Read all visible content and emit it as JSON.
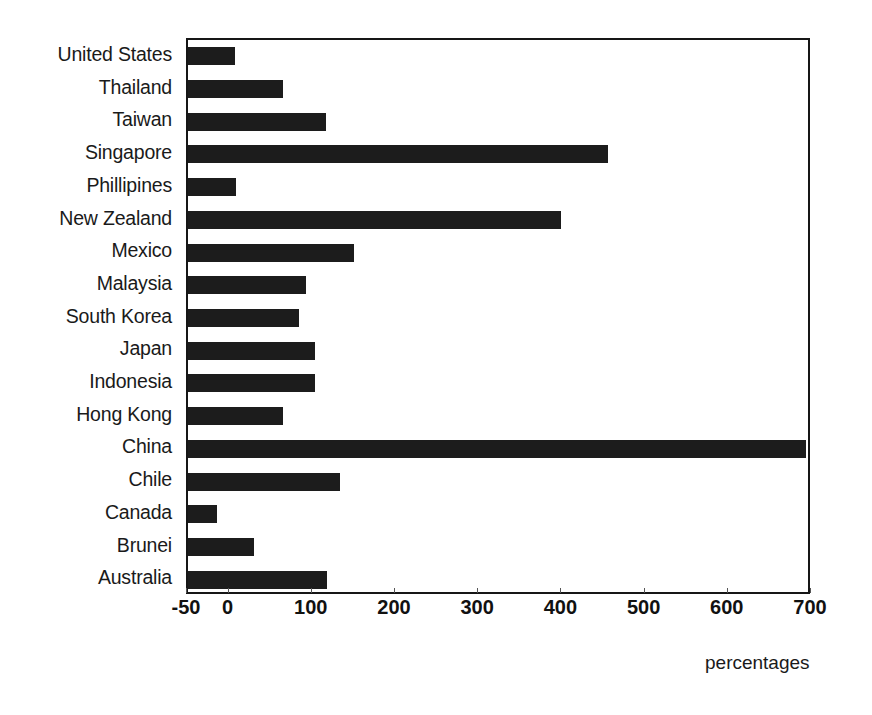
{
  "chart_data": {
    "type": "bar",
    "orientation": "horizontal",
    "title": "",
    "subtitle": "",
    "xlabel": "percentages",
    "ylabel": "",
    "categories": [
      "United States",
      "Thailand",
      "Taiwan",
      "Singapore",
      "Phillipines",
      "New Zealand",
      "Mexico",
      "Malaysia",
      "South Korea",
      "Japan",
      "Indonesia",
      "Hong Kong",
      "China",
      "Chile",
      "Canada",
      "Brunei",
      "Australia"
    ],
    "values": [
      7,
      64,
      116,
      455,
      8,
      398,
      149,
      92,
      83,
      103,
      103,
      64,
      693,
      133,
      -15,
      29,
      117
    ],
    "xlim": [
      -50,
      700
    ],
    "xticks": [
      -50,
      0,
      100,
      200,
      300,
      400,
      500,
      600,
      700
    ],
    "xtick_labels": [
      "-50",
      "0",
      "100",
      "200",
      "300",
      "400",
      "500",
      "600",
      "700"
    ],
    "grid": false,
    "legend": null,
    "bar_color": "#1c1c1c",
    "frame_color": "#161616",
    "background": "#ffffff"
  },
  "axis_caption": "percentages"
}
